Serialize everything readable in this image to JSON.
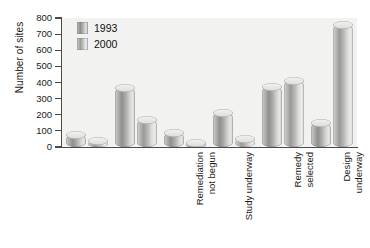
{
  "chart_data": {
    "type": "bar",
    "title": "",
    "xlabel": "",
    "ylabel": "Number of sites",
    "ylim": [
      0,
      800
    ],
    "ytick_step": 100,
    "yticks": [
      800,
      700,
      600,
      500,
      400,
      300,
      200,
      100,
      0
    ],
    "ytick_labels": [
      "800",
      "700",
      "600",
      "500",
      "400",
      "300",
      "200",
      "100",
      "0"
    ],
    "grid": false,
    "legend_position": "top-left",
    "categories": [
      "Remediation\nnot begun",
      "Study underway",
      "Remedy\nselected",
      "Design\nunderway",
      "Construction\nunderway",
      "Construction\ncompleted"
    ],
    "series": [
      {
        "name": "1993",
        "color": "#a9a9a6",
        "values": [
          75,
          365,
          90,
          210,
          375,
          150
        ]
      },
      {
        "name": "2000",
        "color": "#c0c0bd",
        "values": [
          40,
          170,
          25,
          50,
          410,
          755
        ]
      }
    ]
  },
  "legend": {
    "items": [
      {
        "label": "1993",
        "swatch": "legend-swatch-1993"
      },
      {
        "label": "2000",
        "swatch": "legend-swatch-2000"
      }
    ]
  },
  "axes": {
    "y_title": "Number of sites"
  }
}
